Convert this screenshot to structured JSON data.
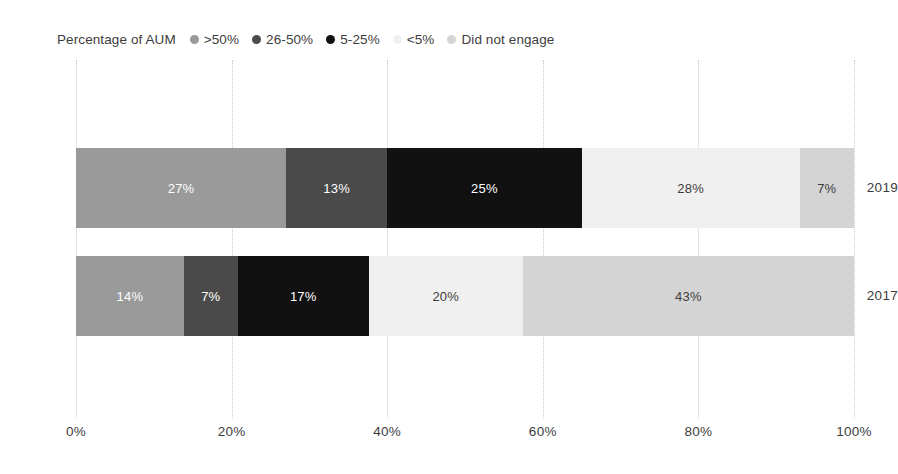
{
  "legend": {
    "title": "Percentage of AUM",
    "items": [
      {
        "label": ">50%",
        "color": "#9a9a9a"
      },
      {
        "label": "26-50%",
        "color": "#4a4a4a"
      },
      {
        "label": "5-25%",
        "color": "#111111"
      },
      {
        "label": "<5%",
        "color": "#f0f0f0"
      },
      {
        "label": "Did not engage",
        "color": "#d4d4d4"
      }
    ]
  },
  "chart_data": {
    "type": "bar",
    "orientation": "horizontal",
    "stacked": true,
    "normalized": true,
    "title": "",
    "xlabel": "",
    "ylabel": "",
    "xlim": [
      0,
      100
    ],
    "grid": true,
    "legend_position": "top-left",
    "categories": [
      "2019",
      "2017"
    ],
    "xticks": [
      "0%",
      "20%",
      "40%",
      "60%",
      "80%",
      "100%"
    ],
    "xtick_values": [
      0,
      20,
      40,
      60,
      80,
      100
    ],
    "series": [
      {
        "name": ">50%",
        "color": "#9a9a9a",
        "values": [
          27,
          14
        ]
      },
      {
        "name": "26-50%",
        "color": "#4a4a4a",
        "values": [
          13,
          7
        ]
      },
      {
        "name": "5-25%",
        "color": "#111111",
        "values": [
          25,
          17
        ]
      },
      {
        "name": "<5%",
        "color": "#f0f0f0",
        "values": [
          28,
          20
        ]
      },
      {
        "name": "Did not engage",
        "color": "#d4d4d4",
        "values": [
          7,
          43
        ]
      }
    ],
    "bars": [
      {
        "category": "2019",
        "segments": [
          {
            "series": ">50%",
            "value": 27,
            "label": "27%",
            "color": "#9a9a9a",
            "text_color": "#ffffff"
          },
          {
            "series": "26-50%",
            "value": 13,
            "label": "13%",
            "color": "#4a4a4a",
            "text_color": "#ffffff"
          },
          {
            "series": "5-25%",
            "value": 25,
            "label": "25%",
            "color": "#111111",
            "text_color": "#ffffff"
          },
          {
            "series": "<5%",
            "value": 28,
            "label": "28%",
            "color": "#f0f0f0",
            "text_color": "#3d3d3d"
          },
          {
            "series": "Did not engage",
            "value": 7,
            "label": "7%",
            "color": "#d4d4d4",
            "text_color": "#3d3d3d"
          }
        ]
      },
      {
        "category": "2017",
        "segments": [
          {
            "series": ">50%",
            "value": 14,
            "label": "14%",
            "color": "#9a9a9a",
            "text_color": "#ffffff"
          },
          {
            "series": "26-50%",
            "value": 7,
            "label": "7%",
            "color": "#4a4a4a",
            "text_color": "#ffffff"
          },
          {
            "series": "5-25%",
            "value": 17,
            "label": "17%",
            "color": "#111111",
            "text_color": "#ffffff"
          },
          {
            "series": "<5%",
            "value": 20,
            "label": "20%",
            "color": "#f0f0f0",
            "text_color": "#3d3d3d"
          },
          {
            "series": "Did not engage",
            "value": 43,
            "label": "43%",
            "color": "#d4d4d4",
            "text_color": "#3d3d3d"
          }
        ]
      }
    ]
  },
  "colors": {
    "background": "#ffffff",
    "gridline": "#c9c9c9",
    "text": "#3d3d3d"
  }
}
